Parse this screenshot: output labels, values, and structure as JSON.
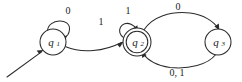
{
  "diagram": {
    "type": "finite-state-machine",
    "canvas": {
      "width": 242,
      "height": 82,
      "background": "#ffffff"
    },
    "stroke_color": "#2b2b2b",
    "text_color": "#1a1a1a",
    "alphabet": [
      "0",
      "1"
    ],
    "start_state": "q1",
    "accept_states": [
      "q2"
    ]
  },
  "states": [
    {
      "id": "q1",
      "label": "q",
      "subscript": "1",
      "cx": 53,
      "cy": 42,
      "r": 13,
      "accepting": false,
      "start": true
    },
    {
      "id": "q2",
      "label": "q",
      "subscript": "2",
      "cx": 137,
      "cy": 42,
      "r": 14,
      "r_inner": 10.8,
      "accepting": true,
      "start": false
    },
    {
      "id": "q3",
      "label": "q",
      "subscript": "3",
      "cx": 218,
      "cy": 42,
      "r": 13,
      "accepting": false,
      "start": false
    }
  ],
  "transitions": [
    {
      "id": "t-q1-q1",
      "from": "q1",
      "to": "q1",
      "symbol": "0",
      "kind": "self-loop",
      "label_x": 68,
      "label_y": 12
    },
    {
      "id": "t-q1-q2",
      "from": "q1",
      "to": "q2",
      "symbol": "1",
      "kind": "curve",
      "label_x": 101,
      "label_y": 23
    },
    {
      "id": "t-q2-q2",
      "from": "q2",
      "to": "q2",
      "symbol": "1",
      "kind": "self-loop",
      "label_x": 128,
      "label_y": 12
    },
    {
      "id": "t-q2-q3",
      "from": "q2",
      "to": "q3",
      "symbol": "0",
      "kind": "arc-top",
      "label_x": 178,
      "label_y": 8
    },
    {
      "id": "t-q3-q2",
      "from": "q3",
      "to": "q2",
      "symbol": "0, 1",
      "kind": "arc-bottom",
      "label_x": 177,
      "label_y": 74
    }
  ],
  "start_arrow": {
    "id": "start-arrow",
    "from_x": 7,
    "from_y": 77,
    "to_x": 44,
    "to_y": 50
  }
}
